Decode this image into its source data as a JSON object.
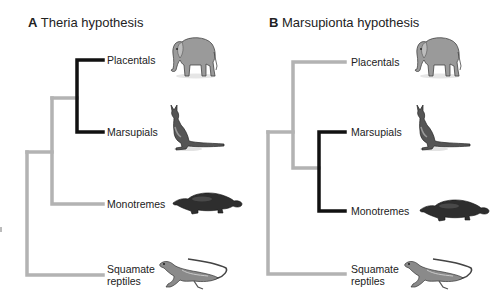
{
  "colors": {
    "gray_branch": "#b3b3b3",
    "black_branch": "#111111",
    "text": "#222222"
  },
  "panels": [
    {
      "letter": "A",
      "title": "Theria hypothesis",
      "taxa": [
        {
          "label": "Placentals",
          "animal": "elephant"
        },
        {
          "label": "Marsupials",
          "animal": "kangaroo"
        },
        {
          "label": "Monotremes",
          "animal": "platypus"
        },
        {
          "label_line1": "Squamate",
          "label_line2": "reptiles",
          "animal": "lizard"
        }
      ],
      "highlighted_clade": [
        "Placentals",
        "Marsupials"
      ]
    },
    {
      "letter": "B",
      "title": "Marsupionta hypothesis",
      "taxa": [
        {
          "label": "Placentals",
          "animal": "elephant"
        },
        {
          "label": "Marsupials",
          "animal": "kangaroo"
        },
        {
          "label": "Monotremes",
          "animal": "platypus"
        },
        {
          "label_line1": "Squamate",
          "label_line2": "reptiles",
          "animal": "lizard"
        }
      ],
      "highlighted_clade": [
        "Marsupials",
        "Monotremes"
      ]
    }
  ]
}
